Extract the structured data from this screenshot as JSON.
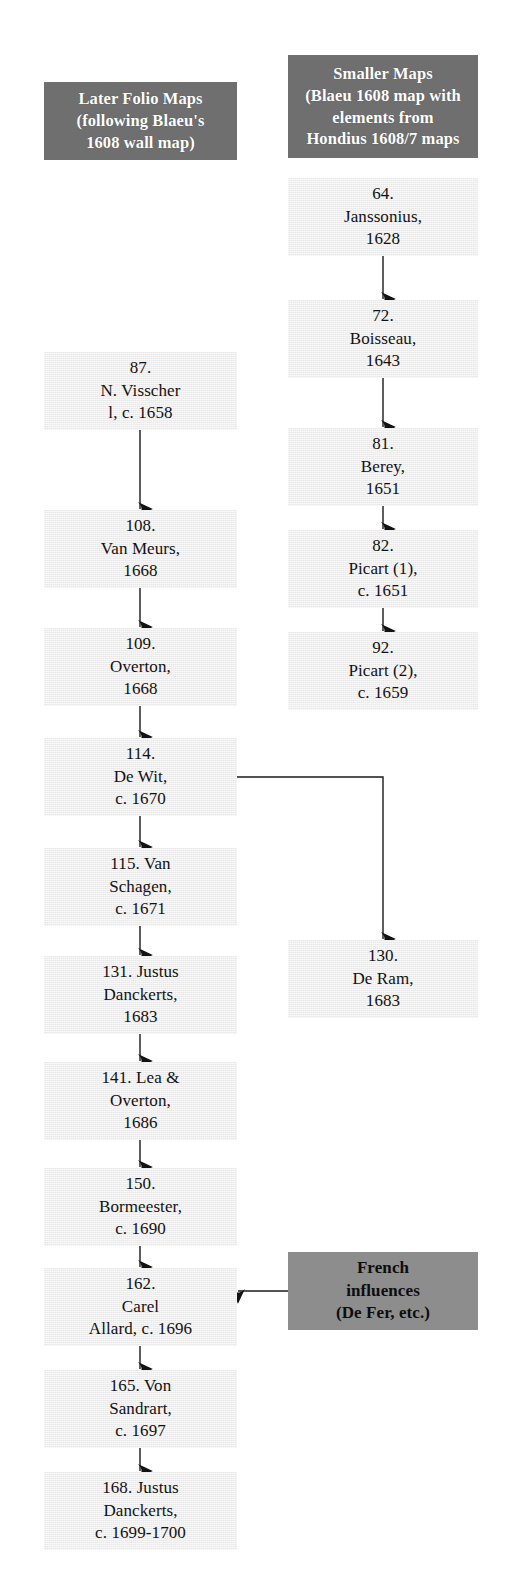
{
  "diagram": {
    "title_left_column": "Later Folio Maps",
    "title_right_column": "Smaller Maps",
    "colors": {
      "header_box": "#6f6f6f",
      "note_box": "#8d8d8d",
      "node_box": "#e8e8e8",
      "text_dark": "#111111",
      "text_light": "#ffffff",
      "connector": "#1a1a1a"
    }
  },
  "headers": {
    "left": {
      "lines": [
        "Later Folio Maps",
        "(following Blaeu's",
        "1608 wall map)"
      ],
      "x": 44,
      "y": 82,
      "w": 193,
      "h": 78
    },
    "right": {
      "lines": [
        "Smaller Maps",
        "(Blaeu 1608 map with",
        "elements from",
        "Hondius 1608/7 maps"
      ],
      "x": 288,
      "y": 55,
      "w": 190,
      "h": 103
    }
  },
  "left_column": [
    {
      "id": "visscher",
      "lines": [
        "87.",
        "N. Visscher",
        "l, c. 1658"
      ],
      "x": 44,
      "y": 352,
      "w": 193,
      "h": 78
    },
    {
      "id": "vanmeurs",
      "lines": [
        "108.",
        "Van Meurs,",
        "1668"
      ],
      "x": 44,
      "y": 510,
      "w": 193,
      "h": 78
    },
    {
      "id": "overton",
      "lines": [
        "109.",
        "Overton,",
        "1668"
      ],
      "x": 44,
      "y": 628,
      "w": 193,
      "h": 78
    },
    {
      "id": "dewit",
      "lines": [
        "114.",
        "De Wit,",
        "c. 1670"
      ],
      "x": 44,
      "y": 738,
      "w": 193,
      "h": 78
    },
    {
      "id": "vanschagen",
      "lines": [
        "115. Van",
        "Schagen,",
        "c. 1671"
      ],
      "x": 44,
      "y": 848,
      "w": 193,
      "h": 78
    },
    {
      "id": "danckerts1",
      "lines": [
        "131. Justus",
        "Danckerts,",
        "1683"
      ],
      "x": 44,
      "y": 956,
      "w": 193,
      "h": 78
    },
    {
      "id": "lea",
      "lines": [
        "141. Lea &",
        "Overton,",
        "1686"
      ],
      "x": 44,
      "y": 1062,
      "w": 193,
      "h": 78
    },
    {
      "id": "bormeester",
      "lines": [
        "150.",
        "Bormeester,",
        "c. 1690"
      ],
      "x": 44,
      "y": 1168,
      "w": 193,
      "h": 78
    },
    {
      "id": "allard",
      "lines": [
        "162.",
        "Carel",
        "Allard, c. 1696"
      ],
      "x": 44,
      "y": 1268,
      "w": 193,
      "h": 78
    },
    {
      "id": "sandrart",
      "lines": [
        "165. Von",
        "Sandrart,",
        "c. 1697"
      ],
      "x": 44,
      "y": 1370,
      "w": 193,
      "h": 78
    },
    {
      "id": "danckerts2",
      "lines": [
        "168. Justus",
        "Danckerts,",
        "c. 1699-1700"
      ],
      "x": 44,
      "y": 1472,
      "w": 193,
      "h": 78
    }
  ],
  "right_column": [
    {
      "id": "janssonius",
      "lines": [
        "64.",
        "Janssonius,",
        "1628"
      ],
      "x": 288,
      "y": 178,
      "w": 190,
      "h": 78
    },
    {
      "id": "boisseau",
      "lines": [
        "72.",
        "Boisseau,",
        "1643"
      ],
      "x": 288,
      "y": 300,
      "w": 190,
      "h": 78
    },
    {
      "id": "berey",
      "lines": [
        "81.",
        "Berey,",
        "1651"
      ],
      "x": 288,
      "y": 428,
      "w": 190,
      "h": 78
    },
    {
      "id": "picart1",
      "lines": [
        "82.",
        "Picart (1),",
        "c. 1651"
      ],
      "x": 288,
      "y": 530,
      "w": 190,
      "h": 78
    },
    {
      "id": "picart2",
      "lines": [
        "92.",
        "Picart (2),",
        "c. 1659"
      ],
      "x": 288,
      "y": 632,
      "w": 190,
      "h": 78
    },
    {
      "id": "deram",
      "lines": [
        "130.",
        "De Ram,",
        "1683"
      ],
      "x": 288,
      "y": 940,
      "w": 190,
      "h": 78
    }
  ],
  "notes": [
    {
      "id": "french",
      "lines": [
        "French",
        "influences",
        "(De Fer, etc.)"
      ],
      "x": 288,
      "y": 1252,
      "w": 190,
      "h": 78
    }
  ],
  "connectors": [
    {
      "id": "janssonius-to-boisseau",
      "kind": "straight-down",
      "x": 383,
      "y1": 256,
      "y2": 300
    },
    {
      "id": "boisseau-to-berey",
      "kind": "straight-down",
      "x": 383,
      "y1": 378,
      "y2": 428
    },
    {
      "id": "berey-to-picart1",
      "kind": "straight-down",
      "x": 383,
      "y1": 506,
      "y2": 530
    },
    {
      "id": "picart1-to-picart2",
      "kind": "straight-down",
      "x": 383,
      "y1": 608,
      "y2": 632
    },
    {
      "id": "visscher-to-vanmeurs",
      "kind": "straight-down",
      "x": 140,
      "y1": 430,
      "y2": 510
    },
    {
      "id": "vanmeurs-to-overton",
      "kind": "straight-down",
      "x": 140,
      "y1": 588,
      "y2": 628
    },
    {
      "id": "overton-to-dewit",
      "kind": "straight-down",
      "x": 140,
      "y1": 706,
      "y2": 738
    },
    {
      "id": "dewit-to-vanschagen",
      "kind": "straight-down",
      "x": 140,
      "y1": 816,
      "y2": 848
    },
    {
      "id": "vanschagen-to-danckerts1",
      "kind": "straight-down",
      "x": 140,
      "y1": 926,
      "y2": 956
    },
    {
      "id": "danckerts1-to-lea",
      "kind": "straight-down",
      "x": 140,
      "y1": 1034,
      "y2": 1062
    },
    {
      "id": "lea-to-bormeester",
      "kind": "straight-down",
      "x": 140,
      "y1": 1140,
      "y2": 1168
    },
    {
      "id": "bormeester-to-allard",
      "kind": "straight-down",
      "x": 140,
      "y1": 1246,
      "y2": 1268
    },
    {
      "id": "allard-to-sandrart",
      "kind": "straight-down",
      "x": 140,
      "y1": 1346,
      "y2": 1370
    },
    {
      "id": "sandrart-to-danckerts2",
      "kind": "straight-down",
      "x": 140,
      "y1": 1448,
      "y2": 1472
    },
    {
      "id": "dewit-to-deram",
      "kind": "elbow-right-down",
      "x1": 237,
      "y1": 777,
      "x2": 383,
      "y2": 940
    },
    {
      "id": "french-to-allard",
      "kind": "arrow-left",
      "x1": 288,
      "x2": 237,
      "y": 1291
    }
  ]
}
